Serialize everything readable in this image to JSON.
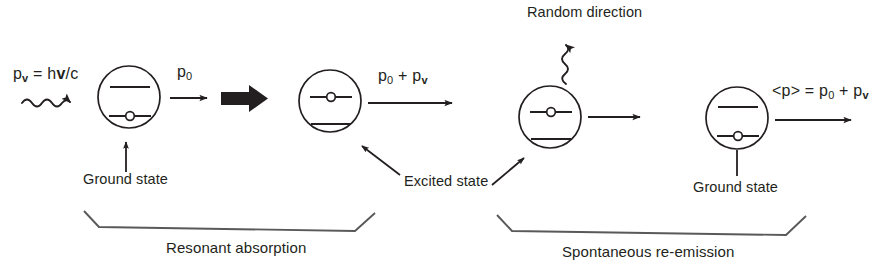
{
  "figure": {
    "type": "physics-diagram",
    "background_color": "#ffffff",
    "ink_color": "#231f20"
  },
  "labels": {
    "photon_momentum": {
      "base": "p",
      "sub": "v",
      "equals": "=",
      "value": "hv/c",
      "full": "p_v = hv/c"
    },
    "atom_momentum_initial": {
      "base": "p",
      "sub": "0",
      "full": "p_0"
    },
    "atom_momentum_after_absorption": {
      "full": "p_0 + p_v"
    },
    "mean_momentum": {
      "full": "<p> = p_0 + p_v"
    },
    "ground_state_left": "Ground state",
    "excited_state": "Excited state",
    "random_direction": "Random direction",
    "ground_state_right": "Ground state",
    "caption_left": "Resonant absorption",
    "caption_right": "Spontaneous re-emission"
  },
  "atoms": [
    {
      "name": "atom-1-ground",
      "electron_level": "lower",
      "cx": 129,
      "cy": 97,
      "r": 31
    },
    {
      "name": "atom-2-excited",
      "electron_level": "upper",
      "cx": 330,
      "cy": 101,
      "r": 31
    },
    {
      "name": "atom-3-excited",
      "electron_level": "upper",
      "cx": 550,
      "cy": 117,
      "r": 31
    },
    {
      "name": "atom-4-ground",
      "electron_level": "lower",
      "cx": 737,
      "cy": 118,
      "r": 31
    }
  ],
  "stages": [
    {
      "name": "resonant-absorption",
      "label": "Resonant absorption"
    },
    {
      "name": "spontaneous-re-emission",
      "label": "Spontaneous re-emission"
    }
  ]
}
